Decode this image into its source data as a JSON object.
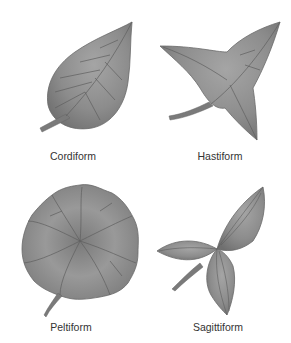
{
  "figure": {
    "leaves": [
      {
        "id": "cordiform",
        "label": "Cordiform",
        "shape": "heart-shaped leaf"
      },
      {
        "id": "hastiform",
        "label": "Hastiform",
        "shape": "spear-shaped leaf with spreading basal lobes"
      },
      {
        "id": "peltiform",
        "label": "Peltiform",
        "shape": "round shield-shaped leaf with central petiole attachment"
      },
      {
        "id": "sagittiform",
        "label": "Sagittiform",
        "shape": "arrow-shaped leaf"
      }
    ],
    "colors": {
      "leaf_fill": "#8a8a8a",
      "leaf_light": "#a8a8a8",
      "leaf_dark": "#6e6e6e",
      "vein": "#5a5a5a",
      "label_text": "#333333",
      "background": "#ffffff"
    }
  }
}
